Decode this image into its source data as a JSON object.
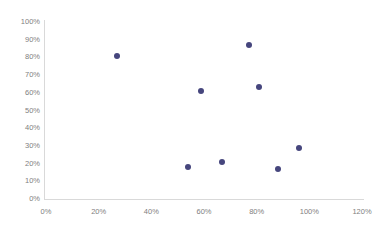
{
  "chart_data": {
    "type": "scatter",
    "title": "",
    "xlabel": "",
    "ylabel": "",
    "xlim": [
      0,
      120
    ],
    "ylim": [
      0,
      100
    ],
    "grid": false,
    "legend": null,
    "marker_color": "#46467d",
    "axis_color": "#d9d9d9",
    "tick_text_color": "#808080",
    "x_tick_labels": [
      "0%",
      "20%",
      "40%",
      "60%",
      "80%",
      "100%",
      "120%"
    ],
    "x_tick_values": [
      0,
      20,
      40,
      60,
      80,
      100,
      120
    ],
    "y_tick_labels": [
      "0%",
      "10%",
      "20%",
      "30%",
      "40%",
      "50%",
      "60%",
      "70%",
      "80%",
      "90%",
      "100%"
    ],
    "y_tick_values": [
      0,
      10,
      20,
      30,
      40,
      50,
      60,
      70,
      80,
      90,
      100
    ],
    "points": [
      {
        "x": 27,
        "y": 81
      },
      {
        "x": 54,
        "y": 18
      },
      {
        "x": 59,
        "y": 61
      },
      {
        "x": 67,
        "y": 21
      },
      {
        "x": 77,
        "y": 87
      },
      {
        "x": 81,
        "y": 63
      },
      {
        "x": 88,
        "y": 17
      },
      {
        "x": 96,
        "y": 29
      }
    ]
  }
}
